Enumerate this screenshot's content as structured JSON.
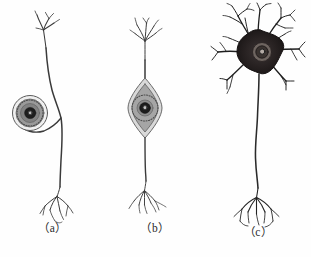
{
  "figure": {
    "background_color": "#fefefe",
    "ink_color": "#3a3a3a",
    "soma_fill_color": "#8f8f8f",
    "nucleus_color": "#1c1c1c",
    "multipolar_soma_color": "#2a2424",
    "panels": [
      {
        "id": "a",
        "caption": "（a）",
        "neuron_type": "unipolar-neuron",
        "description": "Unipolar (pseudounipolar) neuron with round soma on a looping stalk beside the axon",
        "soma_shape": "round",
        "soma_center_x": 30,
        "soma_center_y": 113,
        "soma_radius": 17,
        "axon_x": 62,
        "dendrite_tree_top_y": 12,
        "terminal_branch_top_y": 186
      },
      {
        "id": "b",
        "caption": "（b）",
        "neuron_type": "bipolar-neuron",
        "description": "Bipolar neuron with spindle-shaped soma centered on the vertical process",
        "soma_shape": "spindle",
        "soma_center_x": 40,
        "soma_center_y": 108,
        "soma_half_width": 17,
        "soma_half_height": 28,
        "dendrite_tree_top_y": 18,
        "terminal_branch_top_y": 180
      },
      {
        "id": "c",
        "caption": "（c）",
        "neuron_type": "multipolar-neuron",
        "description": "Multipolar neuron with dark star-shaped soma, many radiating branched dendrites, and long descending axon",
        "soma_shape": "star",
        "soma_center_x": 55,
        "soma_center_y": 52,
        "soma_radius": 21,
        "dendrite_count": 9,
        "axon_x": 53,
        "terminal_branch_top_y": 188
      }
    ]
  }
}
